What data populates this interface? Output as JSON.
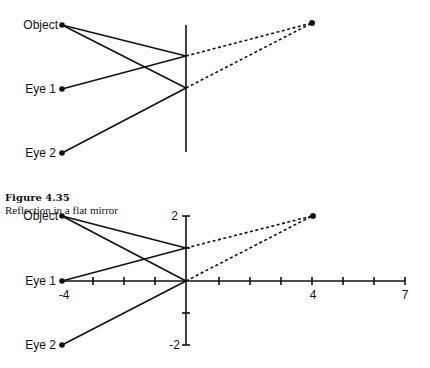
{
  "top_diagram": {
    "labels": {
      "object": "Object",
      "eye1": "Eye 1",
      "eye2": "Eye 2"
    },
    "points": {
      "object": [
        62,
        25
      ],
      "eye1": [
        62,
        89
      ],
      "eye2": [
        62,
        153
      ],
      "reflect1": [
        186,
        56
      ],
      "reflect2": [
        186,
        88
      ],
      "image": [
        312,
        23
      ]
    },
    "mirror": {
      "x": 186,
      "y1": 25,
      "y2": 152
    }
  },
  "caption": {
    "title": "Figure 4.35",
    "text": "Reflection in a flat mirror"
  },
  "bottom_diagram": {
    "labels": {
      "object": "Object",
      "eye1": "Eye 1",
      "eye2": "Eye 2"
    },
    "axis_labels": {
      "y_top": "2",
      "y_bottom": "-2",
      "x_left": "-4",
      "x_mid": "4",
      "x_right": "7"
    },
    "coordinates": {
      "object": [
        -4,
        2
      ],
      "eye1": [
        -4,
        0
      ],
      "eye2": [
        -4,
        -2
      ],
      "reflect1": [
        0,
        1
      ],
      "reflect2": [
        0,
        0
      ],
      "image": [
        4,
        2
      ]
    },
    "x_range": [
      -4,
      7
    ],
    "y_range": [
      -2,
      2
    ]
  }
}
